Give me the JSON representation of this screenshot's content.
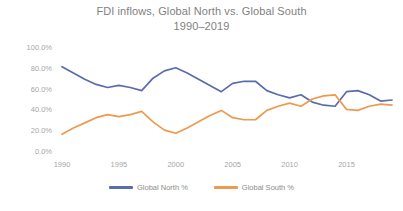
{
  "chart_data": {
    "type": "line",
    "title": "FDI inflows, Global North vs. Global South",
    "subtitle": "1990–2019",
    "title_line1": "FDI inflows, Global North vs. Global South",
    "title_line2": "1990–2019",
    "xlabel": "",
    "ylabel": "",
    "ylim": [
      0,
      100
    ],
    "xlim": [
      1990,
      2019
    ],
    "grid": false,
    "legend_position": "bottom",
    "y_tick_labels": [
      "100.0%",
      "80.0%",
      "60.0%",
      "40.0%",
      "20.0%",
      "0.0%"
    ],
    "y_tick_values": [
      100,
      80,
      60,
      40,
      20,
      0
    ],
    "x_tick_labels": [
      "1990",
      "1995",
      "2000",
      "2005",
      "2010",
      "2015"
    ],
    "x_tick_values": [
      1990,
      1995,
      2000,
      2005,
      2010,
      2015
    ],
    "x": [
      1990,
      1991,
      1992,
      1993,
      1994,
      1995,
      1996,
      1997,
      1998,
      1999,
      2000,
      2001,
      2002,
      2003,
      2004,
      2005,
      2006,
      2007,
      2008,
      2009,
      2010,
      2011,
      2012,
      2013,
      2014,
      2015,
      2016,
      2017,
      2018,
      2019
    ],
    "series": [
      {
        "name": "Global North %",
        "color": "#5b6bad",
        "values": [
          82.0,
          76.0,
          70.0,
          65.0,
          62.0,
          64.0,
          62.0,
          59.0,
          71.0,
          78.0,
          81.0,
          76.0,
          70.0,
          64.0,
          58.0,
          66.0,
          68.0,
          68.0,
          59.0,
          55.0,
          52.0,
          55.0,
          48.0,
          45.0,
          44.0,
          58.0,
          59.0,
          55.0,
          49.0,
          50.0
        ]
      },
      {
        "name": "Global South %",
        "color": "#ed9a4f",
        "values": [
          17.0,
          23.0,
          28.0,
          33.0,
          36.0,
          34.0,
          36.0,
          39.0,
          29.0,
          21.0,
          18.0,
          23.0,
          29.0,
          35.0,
          40.0,
          33.0,
          31.0,
          31.0,
          40.0,
          44.0,
          47.0,
          44.0,
          51.0,
          54.0,
          55.0,
          41.0,
          40.0,
          44.0,
          46.0,
          45.0
        ]
      }
    ],
    "legend": [
      {
        "label": "Global North %",
        "color": "#5b6bad"
      },
      {
        "label": "Global South %",
        "color": "#ed9a4f"
      }
    ]
  },
  "colors": {
    "background": "#ffffff",
    "title_text": "#7f7f7f",
    "tick_text": "#a6a6a6",
    "legend_text": "#8c8c8c",
    "series_north": "#5b6bad",
    "series_south": "#ed9a4f"
  }
}
